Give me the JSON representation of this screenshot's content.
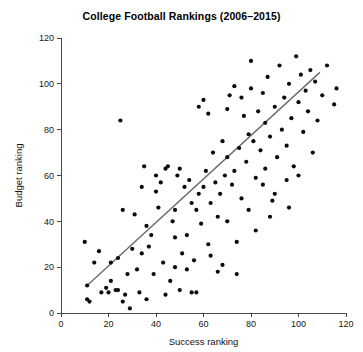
{
  "chart_data": {
    "type": "scatter",
    "title": "College Football Rankings (2006–2015)",
    "xlabel": "Success ranking",
    "ylabel": "Budget ranking",
    "xlim": [
      0,
      120
    ],
    "ylim": [
      0,
      120
    ],
    "xticks": [
      0,
      20,
      40,
      60,
      80,
      100,
      120
    ],
    "yticks": [
      0,
      20,
      40,
      60,
      80,
      100,
      120
    ],
    "grid": false,
    "legend": false,
    "point_color": "#0b0b0b",
    "trend_line_color": "#6b6b6b",
    "trend_line": {
      "x": [
        11,
        109
      ],
      "y": [
        12,
        105
      ]
    },
    "points": [
      [
        10,
        31
      ],
      [
        11,
        12
      ],
      [
        11,
        6
      ],
      [
        12,
        5
      ],
      [
        14,
        22
      ],
      [
        16,
        27
      ],
      [
        17,
        9
      ],
      [
        19,
        11
      ],
      [
        20,
        9
      ],
      [
        21,
        14
      ],
      [
        21,
        22
      ],
      [
        23,
        10
      ],
      [
        24,
        10
      ],
      [
        24,
        24
      ],
      [
        25,
        84
      ],
      [
        26,
        5
      ],
      [
        26,
        45
      ],
      [
        27,
        8
      ],
      [
        28,
        17
      ],
      [
        29,
        2
      ],
      [
        30,
        28
      ],
      [
        31,
        43
      ],
      [
        32,
        19
      ],
      [
        33,
        9
      ],
      [
        34,
        55
      ],
      [
        34,
        26
      ],
      [
        35,
        64
      ],
      [
        36,
        38
      ],
      [
        37,
        29
      ],
      [
        38,
        34
      ],
      [
        39,
        17
      ],
      [
        40,
        53
      ],
      [
        40,
        60
      ],
      [
        41,
        46
      ],
      [
        42,
        57
      ],
      [
        43,
        22
      ],
      [
        44,
        63
      ],
      [
        45,
        64
      ],
      [
        46,
        14
      ],
      [
        47,
        40
      ],
      [
        48,
        45
      ],
      [
        48,
        33
      ],
      [
        49,
        60
      ],
      [
        50,
        63
      ],
      [
        51,
        26
      ],
      [
        52,
        55
      ],
      [
        53,
        34
      ],
      [
        54,
        58
      ],
      [
        55,
        48
      ],
      [
        56,
        23
      ],
      [
        57,
        45
      ],
      [
        58,
        52
      ],
      [
        59,
        39
      ],
      [
        60,
        93
      ],
      [
        60,
        55
      ],
      [
        61,
        62
      ],
      [
        62,
        30
      ],
      [
        63,
        48
      ],
      [
        64,
        70
      ],
      [
        65,
        57
      ],
      [
        66,
        42
      ],
      [
        67,
        52
      ],
      [
        68,
        75
      ],
      [
        68,
        21
      ],
      [
        69,
        60
      ],
      [
        70,
        40
      ],
      [
        70,
        68
      ],
      [
        71,
        95
      ],
      [
        72,
        56
      ],
      [
        73,
        62
      ],
      [
        74,
        31
      ],
      [
        75,
        72
      ],
      [
        76,
        50
      ],
      [
        77,
        86
      ],
      [
        78,
        66
      ],
      [
        79,
        78
      ],
      [
        79,
        45
      ],
      [
        80,
        110
      ],
      [
        80,
        98
      ],
      [
        81,
        75
      ],
      [
        82,
        59
      ],
      [
        83,
        88
      ],
      [
        84,
        71
      ],
      [
        85,
        96
      ],
      [
        86,
        63
      ],
      [
        86,
        83
      ],
      [
        87,
        103
      ],
      [
        88,
        77
      ],
      [
        89,
        49
      ],
      [
        90,
        90
      ],
      [
        91,
        68
      ],
      [
        92,
        108
      ],
      [
        93,
        80
      ],
      [
        94,
        94
      ],
      [
        95,
        73
      ],
      [
        96,
        100
      ],
      [
        97,
        85
      ],
      [
        98,
        64
      ],
      [
        99,
        112
      ],
      [
        100,
        92
      ],
      [
        101,
        104
      ],
      [
        102,
        79
      ],
      [
        103,
        97
      ],
      [
        104,
        88
      ],
      [
        105,
        106
      ],
      [
        106,
        70
      ],
      [
        107,
        101
      ],
      [
        108,
        84
      ],
      [
        110,
        95
      ],
      [
        112,
        108
      ],
      [
        115,
        91
      ],
      [
        116,
        98
      ],
      [
        44,
        8
      ],
      [
        50,
        10
      ],
      [
        55,
        9
      ],
      [
        57,
        9
      ],
      [
        48,
        20
      ],
      [
        53,
        19
      ],
      [
        66,
        18
      ],
      [
        74,
        17
      ],
      [
        36,
        6
      ],
      [
        63,
        25
      ],
      [
        82,
        36
      ],
      [
        88,
        42
      ],
      [
        95,
        58
      ],
      [
        100,
        60
      ],
      [
        58,
        90
      ],
      [
        62,
        87
      ],
      [
        70,
        89
      ],
      [
        73,
        99
      ],
      [
        76,
        94
      ],
      [
        85,
        56
      ],
      [
        90,
        52
      ],
      [
        96,
        46
      ]
    ]
  }
}
